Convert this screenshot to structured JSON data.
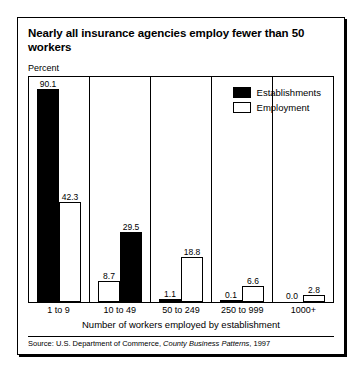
{
  "title": "Nearly all insurance agencies employ fewer than 50 workers",
  "y_axis_label": "Percent",
  "x_axis_title": "Number of workers employed by establishment",
  "source": {
    "prefix": "Source: U.S. Department of Commerce, ",
    "italic": "County Business Patterns",
    "suffix": ", 1997"
  },
  "legend": {
    "items": [
      {
        "label": "Establishments",
        "swatch": "filled",
        "color": "#000000"
      },
      {
        "label": "Employment",
        "swatch": "open",
        "color": "#ffffff"
      }
    ]
  },
  "chart_data": {
    "type": "bar",
    "title": "Nearly all insurance agencies employ fewer than 50 workers",
    "xlabel": "Number of workers employed by establishment",
    "ylabel": "Percent",
    "ylim": [
      0,
      95
    ],
    "grid": false,
    "legend_position": "top-right",
    "categories": [
      "1 to 9",
      "10 to 49",
      "50 to 249",
      "250 to 999",
      "1000+"
    ],
    "series": [
      {
        "name": "Establishments",
        "values": [
          90.1,
          8.7,
          1.1,
          0.1,
          0.0
        ],
        "style": "filled"
      },
      {
        "name": "Employment",
        "values": [
          42.3,
          29.5,
          18.8,
          6.6,
          2.8
        ],
        "style": "open"
      }
    ],
    "groups": [
      {
        "category": "1 to 9",
        "bars": [
          {
            "series": "Establishments",
            "value": 90.1,
            "label": "90.1",
            "style": "filled"
          },
          {
            "series": "Employment",
            "value": 42.3,
            "label": "42.3",
            "style": "open"
          }
        ]
      },
      {
        "category": "10 to 49",
        "bars": [
          {
            "series": "Establishments",
            "value": 8.7,
            "label": "8.7",
            "style": "open"
          },
          {
            "series": "Employment",
            "value": 29.5,
            "label": "29.5",
            "style": "filled"
          }
        ]
      },
      {
        "category": "50 to 249",
        "bars": [
          {
            "series": "Establishments",
            "value": 1.1,
            "label": "1.1",
            "style": "filled"
          },
          {
            "series": "Employment",
            "value": 18.8,
            "label": "18.8",
            "style": "open"
          }
        ]
      },
      {
        "category": "250 to 999",
        "bars": [
          {
            "series": "Establishments",
            "value": 0.1,
            "label": "0.1",
            "style": "filled"
          },
          {
            "series": "Employment",
            "value": 6.6,
            "label": "6.6",
            "style": "open"
          }
        ]
      },
      {
        "category": "1000+",
        "bars": [
          {
            "series": "Establishments",
            "value": 0.0,
            "label": "0.0",
            "style": "filled"
          },
          {
            "series": "Employment",
            "value": 2.8,
            "label": "2.8",
            "style": "open"
          }
        ]
      }
    ]
  }
}
